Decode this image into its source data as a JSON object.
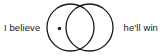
{
  "canvas": {
    "width": 162,
    "height": 56,
    "background_color": "#ffffff"
  },
  "figure": {
    "kind": "venn-diagram-phrase",
    "stroke_color": "#1a1a1a",
    "text_color": "#1a1a1a",
    "left_text": "I believe",
    "right_text": "he'll win",
    "circles": [
      {
        "name": "left-circle",
        "cx": 25.5,
        "cy": 27.5,
        "r": 23.5,
        "stroke_width": 1.3,
        "fill": "none"
      },
      {
        "name": "right-circle",
        "cx": 44.5,
        "cy": 27.5,
        "r": 23.5,
        "stroke_width": 1.3,
        "fill": "none"
      }
    ],
    "marker_dot": {
      "name": "left-circle-dot",
      "cx": 14.5,
      "cy": 28.5,
      "r": 1.7,
      "fill": "#1a1a1a"
    }
  }
}
